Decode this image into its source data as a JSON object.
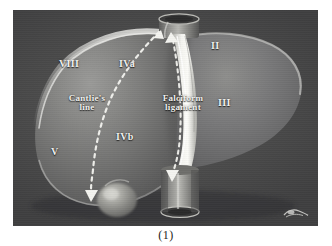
{
  "figure": {
    "caption": "(1)",
    "panel_bg": "#4b4b4b",
    "label_color": "#f2f2f0",
    "illustration": "liver-couinaud-segments-diagram",
    "signature_mark": "artist-signature-mark"
  },
  "segments": [
    {
      "id": "viii",
      "label": "VIII"
    },
    {
      "id": "iva",
      "label": "IVa"
    },
    {
      "id": "ii",
      "label": "II"
    },
    {
      "id": "iii",
      "label": "III"
    },
    {
      "id": "ivb",
      "label": "IVb"
    },
    {
      "id": "v",
      "label": "V"
    }
  ],
  "annotations": {
    "cantlie": {
      "line1": "Cantlie's",
      "line2": "line"
    },
    "falciform": {
      "line1": "Falciform",
      "line2": "ligament"
    }
  },
  "anatomy": {
    "liver": "liver-body",
    "gallbladder": "gallbladder",
    "ivc_superior": "inferior-vena-cava-superior-stump",
    "ivc_inferior": "inferior-vena-cava-inferior-stump",
    "falciform_band": "falciform-ligament-band",
    "cantlie_dashes": "cantlie-line-dashed-path"
  }
}
